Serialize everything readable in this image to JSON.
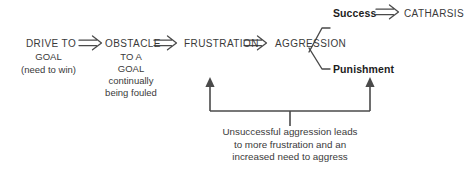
{
  "diagram": {
    "stroke_color": "#4a4a4a",
    "text_color": "#3a3a3a",
    "bold_text_color": "#1d1d1d",
    "background": "#ffffff",
    "nodes": {
      "drive": "DRIVE TO",
      "drive_line2": "GOAL",
      "drive_line3": "(need to win)",
      "obstacle": "OBSTACLE",
      "obstacle_line2": "TO A",
      "obstacle_line3": "GOAL",
      "obstacle_line4": "continually",
      "obstacle_line5": "being fouled",
      "frustration": "FRUSTRATION",
      "aggression": "AGGRESSION",
      "success": "Success",
      "catharsis": "CATHARSIS",
      "punishment": "Punishment"
    },
    "caption": {
      "line1": "Unsuccessful aggression leads",
      "line2": "to more frustration and an",
      "line3": "increased need to aggress"
    },
    "arrows": {
      "drive_to_obstacle": "double-arrow-right",
      "obstacle_to_frustration": "double-arrow-right",
      "frustration_to_aggression": "double-arrow-right",
      "success_to_catharsis": "double-arrow-right",
      "feedback_left": "arrow-up",
      "feedback_right": "arrow-up"
    }
  }
}
